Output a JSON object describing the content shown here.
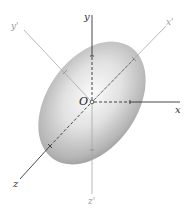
{
  "diagram": {
    "type": "3d-ellipsoid-axes",
    "origin_label": "O",
    "axes": [
      {
        "id": "x",
        "label": "x",
        "direction": "right",
        "style": "solid-from-surface, dashed-inside"
      },
      {
        "id": "y",
        "label": "y",
        "direction": "up",
        "style": "solid-from-surface, dashed-inside"
      },
      {
        "id": "z",
        "label": "z",
        "direction": "down-left",
        "style": "solid-from-surface, dashed-inside"
      },
      {
        "id": "x_prime",
        "label": "x'",
        "direction": "up-right",
        "style": "light"
      },
      {
        "id": "y_prime",
        "label": "y'",
        "direction": "up-left",
        "style": "light"
      },
      {
        "id": "z_prime",
        "label": "z'",
        "direction": "down",
        "style": "light"
      }
    ],
    "colors": {
      "body_light": "#f2f2f2",
      "body_dark": "#8f8f8f",
      "axis_main": "#333333",
      "axis_prime": "#a8a8a8"
    }
  }
}
